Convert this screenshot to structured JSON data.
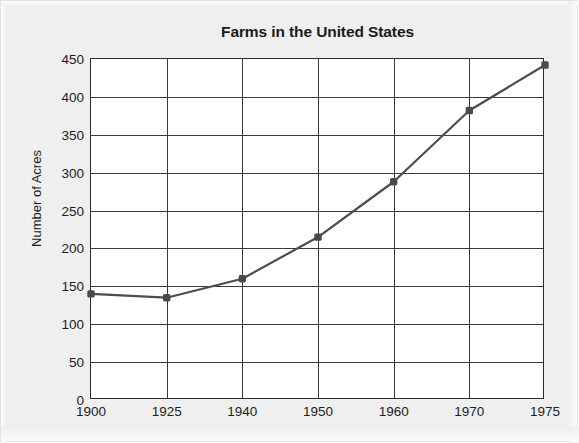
{
  "chart_data": {
    "type": "line",
    "title": "Farms in the United States",
    "xlabel": "",
    "ylabel": "Number of Acres",
    "categories": [
      "1900",
      "1925",
      "1940",
      "1950",
      "1960",
      "1970",
      "1975"
    ],
    "values": [
      140,
      135,
      160,
      215,
      288,
      382,
      442
    ],
    "series": [
      {
        "name": "Number of Acres",
        "values": [
          140,
          135,
          160,
          215,
          288,
          382,
          442
        ]
      }
    ],
    "ylim": [
      0,
      450
    ],
    "y_ticks": [
      0,
      50,
      100,
      150,
      200,
      250,
      300,
      350,
      400,
      450
    ],
    "y_tick_labels": [
      "0",
      "50",
      "100",
      "150",
      "200",
      "250",
      "300",
      "350",
      "400",
      "450"
    ],
    "x_tick_labels": [
      "1900",
      "1925",
      "1940",
      "1950",
      "1960",
      "1970",
      "1975"
    ],
    "grid": true,
    "legend": false,
    "legend_position": "none",
    "marker": "square",
    "colors": {
      "line": "#4d4d4d",
      "marker": "#4a4a4a",
      "grid": "#3a3a3a",
      "axis": "#2b2b2b",
      "plot_background": "#ffffff",
      "page_background": "#efefef",
      "text": "#1d1d1d"
    }
  }
}
